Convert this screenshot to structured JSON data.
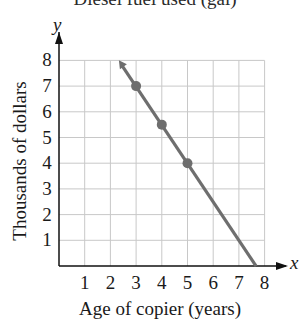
{
  "chart_data": {
    "type": "line",
    "title": "Diesel fuel used (gal)",
    "xlabel": "Age of copier (years)",
    "ylabel": "Thousands of dollars",
    "x_axis_var": "x",
    "y_axis_var": "y",
    "xlim": [
      0,
      8
    ],
    "ylim": [
      0,
      8
    ],
    "x_ticks": [
      "1",
      "2",
      "3",
      "4",
      "5",
      "6",
      "7",
      "8"
    ],
    "y_ticks": [
      "1",
      "2",
      "3",
      "4",
      "5",
      "6",
      "7",
      "8"
    ],
    "grid": true,
    "legend": null,
    "series": [
      {
        "name": "copier value",
        "line": {
          "slope": -1.5,
          "intercept": 11.5,
          "x_start": 2.33,
          "x_end": 7.67,
          "arrow_at_start": true
        },
        "points": [
          {
            "x": 3,
            "y": 7
          },
          {
            "x": 4,
            "y": 5.5
          },
          {
            "x": 5,
            "y": 4
          }
        ]
      }
    ],
    "colors": {
      "line": "#6e6e6e",
      "grid": "#c8c8c8",
      "axis": "#111111"
    }
  }
}
